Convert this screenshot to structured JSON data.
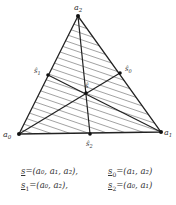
{
  "figure": {
    "type": "2-simplex barycentric subdivision",
    "vertices": [
      {
        "id": "a0",
        "label": "a",
        "sub": "0",
        "x": 19,
        "y": 134
      },
      {
        "id": "a1",
        "label": "a",
        "sub": "1",
        "x": 161,
        "y": 132
      },
      {
        "id": "a2",
        "label": "a",
        "sub": "2",
        "x": 78,
        "y": 16
      }
    ],
    "barycenters": [
      {
        "id": "s_hat",
        "label": "ŝ",
        "sub": "",
        "x": 86,
        "y": 93
      },
      {
        "id": "s0_hat",
        "label": "ŝ",
        "sub": "0",
        "x": 120,
        "y": 73
      },
      {
        "id": "s1_hat",
        "label": "ŝ",
        "sub": "1",
        "x": 48,
        "y": 75
      },
      {
        "id": "s2_hat",
        "label": "ŝ",
        "sub": "2",
        "x": 90,
        "y": 134
      }
    ],
    "fill": "diagonal hatching",
    "line_color": "#222222"
  },
  "formulas": [
    {
      "lhs": "s",
      "lhs_sub": "",
      "rhs": "=(a₀, a₁, a₂),"
    },
    {
      "lhs": "s",
      "lhs_sub": "0",
      "rhs": "=(a₁, a₂)"
    },
    {
      "lhs": "s",
      "lhs_sub": "1",
      "rhs": "=(a₀, a₂),"
    },
    {
      "lhs": "s",
      "lhs_sub": "2",
      "rhs": "=(a₀, a₁)"
    }
  ]
}
